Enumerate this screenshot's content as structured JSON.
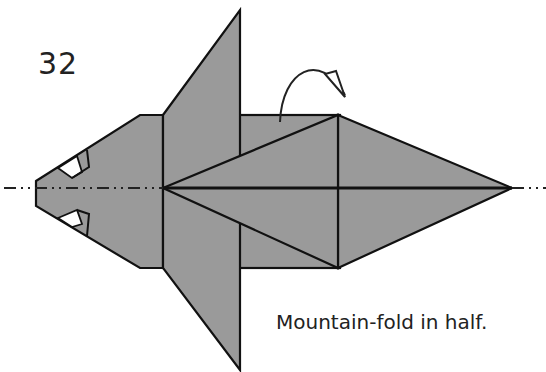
{
  "step": {
    "number": "32"
  },
  "caption": {
    "text": "Mountain-fold in half."
  },
  "diagram": {
    "paper_color": "#9a9a9a",
    "line_color": "#111111",
    "axis_line": "dash-dot center line (fold axis)",
    "fold_arrow": "mountain-fold arrow curving behind, above upper edge"
  },
  "icons": {
    "fold_arrow": "mountain-fold-arrow-icon",
    "axis": "dash-dot-axis-icon"
  }
}
